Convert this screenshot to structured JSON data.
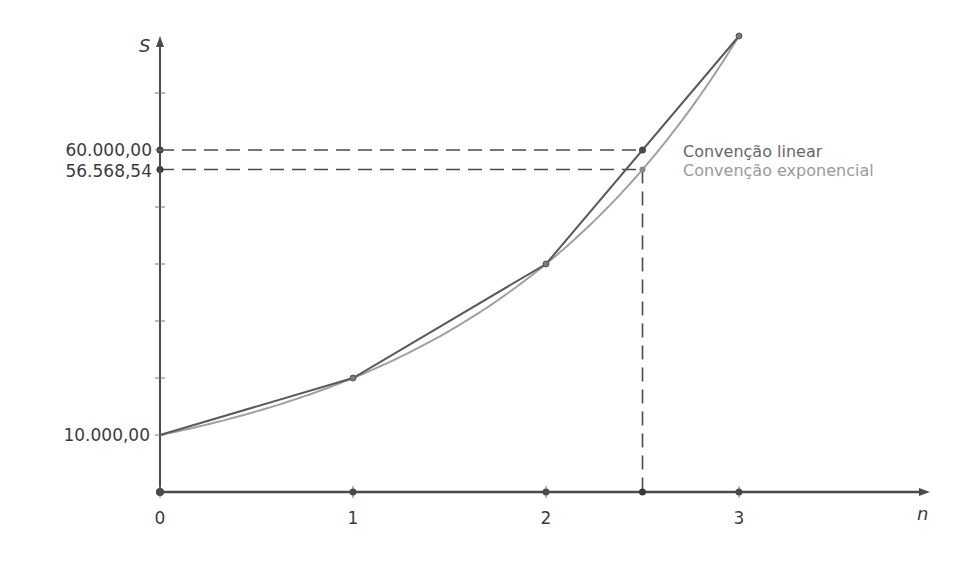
{
  "chart_data": {
    "type": "line",
    "title": "",
    "xlabel": "n",
    "ylabel": "S",
    "xlim": [
      0,
      3.9
    ],
    "ylim": [
      0,
      80000
    ],
    "y_tick_step": 10000,
    "grid": false,
    "x_ticks": [
      0,
      1,
      2,
      3
    ],
    "x_tick_labels": [
      "0",
      "1",
      "2",
      "3"
    ],
    "y_labeled_ticks": [
      {
        "value": 10000,
        "label": "10.000,00"
      },
      {
        "value": 56568.54,
        "label": "56.568,54"
      },
      {
        "value": 60000,
        "label": "60.000,00"
      }
    ],
    "series": [
      {
        "name": "Convenção linear",
        "color": "#555555",
        "kind": "piecewise-linear",
        "x": [
          0,
          1,
          2,
          3
        ],
        "values": [
          10000,
          20000,
          40000,
          80000
        ]
      },
      {
        "name": "Convenção exponencial",
        "color": "#9a9a9a",
        "kind": "exponential",
        "formula": "S = 10000 * 2^n",
        "x": [
          0,
          1,
          2,
          2.5,
          3
        ],
        "values": [
          10000,
          20000,
          40000,
          56568.54,
          80000
        ]
      }
    ],
    "annotations": [
      {
        "x": 2.5,
        "y": 60000,
        "label": "60.000,00",
        "series": "Convenção linear",
        "dashed_guides": true
      },
      {
        "x": 2.5,
        "y": 56568.54,
        "label": "56.568,54",
        "series": "Convenção exponencial",
        "dashed_guides": true
      }
    ],
    "legend": {
      "position": "inline-right-of-intersection",
      "entries": [
        {
          "label": "Convenção linear",
          "color": "#666666"
        },
        {
          "label": "Convenção exponencial",
          "color": "#9a9a9a"
        }
      ]
    }
  },
  "axes": {
    "x_name": "n",
    "y_name": "S"
  },
  "labels": {
    "y10000": "10.000,00",
    "y60000": "60.000,00",
    "y56568": "56.568,54",
    "x0": "0",
    "x1": "1",
    "x2": "2",
    "x3": "3"
  },
  "legend": {
    "linear": "Convenção linear",
    "exponential": "Convenção exponencial"
  },
  "colors": {
    "axis": "#4a4a4a",
    "linear": "#5a5a5a",
    "exponential": "#a0a0a0",
    "dash": "#4a4a4a"
  }
}
